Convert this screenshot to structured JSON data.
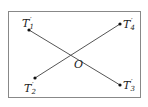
{
  "diagram": {
    "points": [
      {
        "id": "T1",
        "base": "T",
        "prime": "′",
        "sub": "1"
      },
      {
        "id": "T2",
        "base": "T",
        "prime": "′",
        "sub": "2"
      },
      {
        "id": "T3",
        "base": "T",
        "prime": "′",
        "sub": "3"
      },
      {
        "id": "T4",
        "base": "T",
        "prime": "′",
        "sub": "4"
      }
    ],
    "center": {
      "label": "O"
    },
    "segments": [
      {
        "from": "T1",
        "to": "T3",
        "through": "O"
      },
      {
        "from": "T2",
        "to": "T4",
        "through": "O"
      }
    ],
    "colors": {
      "line": "#555555",
      "border": "#888888",
      "dot": "#111111"
    }
  }
}
